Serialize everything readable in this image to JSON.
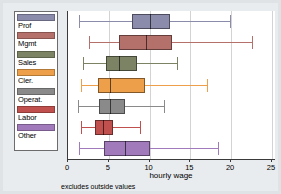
{
  "chart_data": {
    "type": "boxplot",
    "title": "",
    "xlabel": "hourly wage",
    "ylabel": "",
    "xlim": [
      0,
      25.5
    ],
    "grid": true,
    "grid_axis": "x",
    "legend_position": "left",
    "orientation": "horizontal",
    "footnote": "excludes outside values",
    "xticks": [
      0,
      5,
      10,
      15,
      20,
      25
    ],
    "xticklabels": [
      "0",
      "5",
      "10",
      "15",
      "20",
      "25"
    ],
    "categories": [
      "Prof",
      "Mgmt",
      "Sales",
      "Cler.",
      "Operat.",
      "Labor",
      "Other"
    ],
    "colors": [
      "#8b8bab",
      "#b4716b",
      "#7c8365",
      "#eda049",
      "#8a8a8a",
      "#c0504d",
      "#a07aba"
    ],
    "boxes": [
      {
        "label": "Prof",
        "color": "#8b8bab",
        "whisker_low": 1.3,
        "q1": 7.8,
        "median": 10.0,
        "q3": 12.5,
        "whisker_high": 19.9
      },
      {
        "label": "Mgmt",
        "color": "#b4716b",
        "whisker_low": 2.6,
        "q1": 6.2,
        "median": 9.6,
        "q3": 12.8,
        "whisker_high": 22.6
      },
      {
        "label": "Sales",
        "color": "#7c8365",
        "whisker_low": 1.8,
        "q1": 4.6,
        "median": 6.2,
        "q3": 8.5,
        "whisker_high": 13.4
      },
      {
        "label": "Cler.",
        "color": "#eda049",
        "whisker_low": 1.6,
        "q1": 3.7,
        "median": 5.1,
        "q3": 9.5,
        "whisker_high": 17.1
      },
      {
        "label": "Operat.",
        "color": "#8a8a8a",
        "whisker_low": 1.2,
        "q1": 3.8,
        "median": 5.2,
        "q3": 7.0,
        "whisker_high": 11.8
      },
      {
        "label": "Labor",
        "color": "#c0504d",
        "whisker_low": 1.6,
        "q1": 3.3,
        "median": 4.3,
        "q3": 5.5,
        "whisker_high": 8.8
      },
      {
        "label": "Other",
        "color": "#a07aba",
        "whisker_low": 1.3,
        "q1": 4.4,
        "median": 7.0,
        "q3": 10.0,
        "whisker_high": 18.4
      }
    ]
  },
  "legend": {
    "items": [
      {
        "label": "Prof",
        "color": "#8b8bab"
      },
      {
        "label": "Mgmt",
        "color": "#b4716b"
      },
      {
        "label": "Sales",
        "color": "#7c8365"
      },
      {
        "label": "Cler.",
        "color": "#eda049"
      },
      {
        "label": "Operat.",
        "color": "#8a8a8a"
      },
      {
        "label": "Labor",
        "color": "#c0504d"
      },
      {
        "label": "Other",
        "color": "#a07aba"
      }
    ]
  },
  "axis": {
    "title": "hourly wage"
  },
  "note": {
    "text": "excludes outside values"
  }
}
